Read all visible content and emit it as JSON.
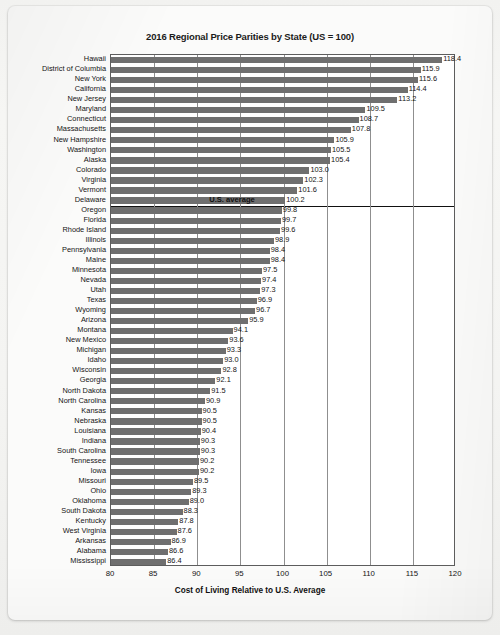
{
  "chart_data": {
    "type": "bar",
    "orientation": "horizontal",
    "title": "2016 Regional Price Parities by State (US = 100)",
    "xlabel": "Cost of Living Relative to U.S. Average",
    "ylabel": "",
    "xlim": [
      80,
      120
    ],
    "xticks": [
      80,
      85,
      90,
      95,
      100,
      105,
      110,
      115,
      120
    ],
    "grid": true,
    "legend": null,
    "bar_color": "#6f6f6f",
    "annotation": {
      "text": "U.S. average",
      "value": 100,
      "description": "horizontal separator line drawn between Delaware (100.2) and Oregon (99.8)"
    },
    "categories": [
      "Hawaii",
      "District of Columbia",
      "New York",
      "California",
      "New Jersey",
      "Maryland",
      "Connecticut",
      "Massachusetts",
      "New Hampshire",
      "Washington",
      "Alaska",
      "Colorado",
      "Virginia",
      "Vermont",
      "Delaware",
      "Oregon",
      "Florida",
      "Rhode Island",
      "Illinois",
      "Pennsylvania",
      "Maine",
      "Minnesota",
      "Nevada",
      "Utah",
      "Texas",
      "Wyoming",
      "Arizona",
      "Montana",
      "New Mexico",
      "Michigan",
      "Idaho",
      "Wisconsin",
      "Georgia",
      "North Dakota",
      "North Carolina",
      "Kansas",
      "Nebraska",
      "Louisiana",
      "Indiana",
      "South Carolina",
      "Tennessee",
      "Iowa",
      "Missouri",
      "Ohio",
      "Oklahoma",
      "South Dakota",
      "Kentucky",
      "West Virginia",
      "Arkansas",
      "Alabama",
      "Mississippi"
    ],
    "values": [
      118.4,
      115.9,
      115.6,
      114.4,
      113.2,
      109.5,
      108.7,
      107.8,
      105.9,
      105.5,
      105.4,
      103.0,
      102.3,
      101.6,
      100.2,
      99.8,
      99.7,
      99.6,
      98.9,
      98.4,
      98.4,
      97.5,
      97.4,
      97.3,
      96.9,
      96.7,
      95.9,
      94.1,
      93.6,
      93.3,
      93.0,
      92.8,
      92.1,
      91.5,
      90.9,
      90.5,
      90.5,
      90.4,
      90.3,
      90.3,
      90.2,
      90.2,
      89.5,
      89.3,
      89.0,
      88.3,
      87.8,
      87.6,
      86.9,
      86.6,
      86.4
    ],
    "value_labels": [
      "118.4",
      "115.9",
      "115.6",
      "114.4",
      "113.2",
      "109.5",
      "108.7",
      "107.8",
      "105.9",
      "105.5",
      "105.4",
      "103.0",
      "102.3",
      "101.6",
      "100.2",
      "99.8",
      "99.7",
      "99.6",
      "98.9",
      "98.4",
      "98.4",
      "97.5",
      "97.4",
      "97.3",
      "96.9",
      "96.7",
      "95.9",
      "94.1",
      "93.6",
      "93.3",
      "93.0",
      "92.8",
      "92.1",
      "91.5",
      "90.9",
      "90.5",
      "90.5",
      "90.4",
      "90.3",
      "90.3",
      "90.2",
      "90.2",
      "89.5",
      "89.3",
      "89.0",
      "88.3",
      "87.8",
      "87.6",
      "86.9",
      "86.6",
      "86.4"
    ]
  }
}
